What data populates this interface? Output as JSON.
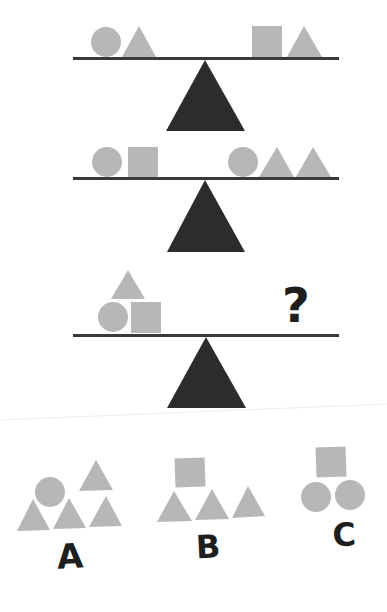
{
  "puzzle": {
    "colors": {
      "shape": "#b7b7b7",
      "beam": "#3a3a3a",
      "fulcrum": "#2c2c2c",
      "text": "#1e1e1e",
      "background": "#ffffff"
    },
    "scales": [
      {
        "id": "scale-1",
        "left_pan": [
          "circle",
          "triangle"
        ],
        "right_pan": [
          "square",
          "triangle"
        ]
      },
      {
        "id": "scale-2",
        "left_pan": [
          "circle",
          "square"
        ],
        "right_pan": [
          "circle",
          "triangle",
          "triangle"
        ]
      },
      {
        "id": "scale-3",
        "left_pan": [
          "triangle (stacked on top)",
          "circle",
          "square"
        ],
        "right_pan_label": "?"
      }
    ],
    "options": [
      {
        "label": "A",
        "shapes": [
          "circle",
          "triangle",
          "triangle",
          "triangle",
          "triangle"
        ]
      },
      {
        "label": "B",
        "shapes": [
          "square",
          "triangle",
          "triangle",
          "triangle"
        ]
      },
      {
        "label": "C",
        "shapes": [
          "square",
          "circle",
          "circle"
        ]
      }
    ]
  }
}
